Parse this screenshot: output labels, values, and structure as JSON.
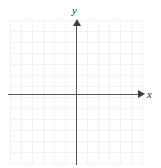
{
  "figure": {
    "title": "",
    "background_color": "#ffffff"
  },
  "axes": {
    "x": {
      "label": "x",
      "color": "#595959",
      "arrow_direction": "right",
      "arrow_color": "#3d3d3d"
    },
    "y": {
      "label": "y",
      "color": "#595959",
      "arrow_direction": "up",
      "arrow_color": "#3d3d3d"
    }
  },
  "grid": {
    "color": "#ececec",
    "cell_size_px": 11,
    "columns": 12,
    "rows": 13
  },
  "chart_data": {
    "type": "scatter",
    "title": "",
    "xlabel": "x",
    "ylabel": "y",
    "series": [
      {
        "name": "",
        "x": [],
        "y": [],
        "values": []
      }
    ],
    "x": [],
    "values": [],
    "categories": [],
    "xlim": [
      -6,
      6
    ],
    "ylim": [
      -6,
      7
    ],
    "xticks": [
      -6,
      -5,
      -4,
      -3,
      -2,
      -1,
      0,
      1,
      2,
      3,
      4,
      5,
      6
    ],
    "yticks": [
      -6,
      -5,
      -4,
      -3,
      -2,
      -1,
      0,
      1,
      2,
      3,
      4,
      5,
      6,
      7
    ],
    "xtick_labels": [],
    "ytick_labels": [],
    "grid": true,
    "legend": false,
    "legend_position": "none",
    "annotations": []
  }
}
